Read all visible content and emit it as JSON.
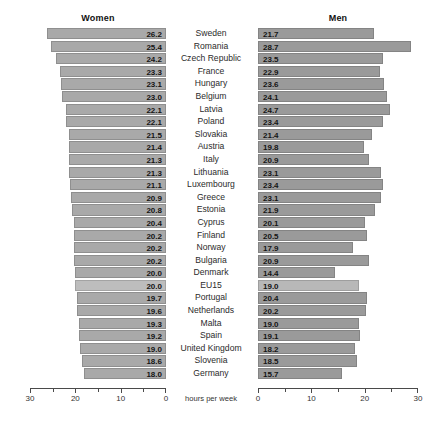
{
  "chart_data": {
    "type": "bar",
    "title": "",
    "subtitle": "",
    "orientation": "horizontal-diverging",
    "xlabel": "hours per week",
    "ylabel": "",
    "grid": false,
    "legend_position": "top",
    "axes": {
      "left": {
        "label": "hours per week",
        "direction": "right-to-left",
        "range": [
          0,
          30
        ],
        "major_ticks": [
          30,
          20,
          10,
          0
        ],
        "tick_labels": [
          "30",
          "20",
          "10",
          "0"
        ],
        "minor_ticks": [
          25,
          15,
          5
        ]
      },
      "right": {
        "label": "hours per week",
        "direction": "left-to-right",
        "range": [
          0,
          30
        ],
        "major_ticks": [
          0,
          10,
          20,
          30
        ],
        "tick_labels": [
          "0",
          "10",
          "20",
          "30"
        ],
        "minor_ticks": [
          5,
          15,
          25
        ]
      }
    },
    "series": [
      {
        "name": "Women",
        "panel": "left",
        "color": "#a9a9a9",
        "values": [
          26.2,
          25.4,
          24.2,
          23.3,
          23.1,
          23.0,
          22.1,
          22.1,
          21.5,
          21.4,
          21.3,
          21.3,
          21.1,
          20.9,
          20.8,
          20.4,
          20.2,
          20.2,
          20.2,
          20.0,
          20.0,
          19.7,
          19.6,
          19.3,
          19.2,
          19.0,
          18.6,
          18.0
        ]
      },
      {
        "name": "Men",
        "panel": "right",
        "color": "#9a9a9a",
        "values": [
          21.7,
          28.7,
          23.5,
          22.9,
          23.6,
          24.1,
          24.7,
          23.4,
          21.4,
          19.8,
          20.9,
          23.1,
          23.4,
          23.1,
          21.9,
          20.1,
          20.5,
          17.9,
          20.9,
          14.4,
          19.0,
          20.4,
          20.2,
          19.0,
          19.1,
          18.2,
          18.5,
          15.7
        ]
      }
    ],
    "categories": [
      "Sweden",
      "Romania",
      "Czech Republic",
      "France",
      "Hungary",
      "Belgium",
      "Latvia",
      "Poland",
      "Slovakia",
      "Austria",
      "Italy",
      "Lithuania",
      "Luxembourg",
      "Greece",
      "Estonia",
      "Cyprus",
      "Finland",
      "Norway",
      "Bulgaria",
      "Denmark",
      "EU15",
      "Portugal",
      "Netherlands",
      "Malta",
      "Spain",
      "United Kingdom",
      "Slovenia",
      "Germany"
    ],
    "highlight_category": "EU15",
    "rows": [
      {
        "country": "Sweden",
        "women": 26.2,
        "men": 21.7,
        "highlight": false
      },
      {
        "country": "Romania",
        "women": 25.4,
        "men": 28.7,
        "highlight": false
      },
      {
        "country": "Czech Republic",
        "women": 24.2,
        "men": 23.5,
        "highlight": false
      },
      {
        "country": "France",
        "women": 23.3,
        "men": 22.9,
        "highlight": false
      },
      {
        "country": "Hungary",
        "women": 23.1,
        "men": 23.6,
        "highlight": false
      },
      {
        "country": "Belgium",
        "women": 23.0,
        "men": 24.1,
        "highlight": false
      },
      {
        "country": "Latvia",
        "women": 22.1,
        "men": 24.7,
        "highlight": false
      },
      {
        "country": "Poland",
        "women": 22.1,
        "men": 23.4,
        "highlight": false
      },
      {
        "country": "Slovakia",
        "women": 21.5,
        "men": 21.4,
        "highlight": false
      },
      {
        "country": "Austria",
        "women": 21.4,
        "men": 19.8,
        "highlight": false
      },
      {
        "country": "Italy",
        "women": 21.3,
        "men": 20.9,
        "highlight": false
      },
      {
        "country": "Lithuania",
        "women": 21.3,
        "men": 23.1,
        "highlight": false
      },
      {
        "country": "Luxembourg",
        "women": 21.1,
        "men": 23.4,
        "highlight": false
      },
      {
        "country": "Greece",
        "women": 20.9,
        "men": 23.1,
        "highlight": false
      },
      {
        "country": "Estonia",
        "women": 20.8,
        "men": 21.9,
        "highlight": false
      },
      {
        "country": "Cyprus",
        "women": 20.4,
        "men": 20.1,
        "highlight": false
      },
      {
        "country": "Finland",
        "women": 20.2,
        "men": 20.5,
        "highlight": false
      },
      {
        "country": "Norway",
        "women": 20.2,
        "men": 17.9,
        "highlight": false
      },
      {
        "country": "Bulgaria",
        "women": 20.2,
        "men": 20.9,
        "highlight": false
      },
      {
        "country": "Denmark",
        "women": 20.0,
        "men": 14.4,
        "highlight": false
      },
      {
        "country": "EU15",
        "women": 20.0,
        "men": 19.0,
        "highlight": true
      },
      {
        "country": "Portugal",
        "women": 19.7,
        "men": 20.4,
        "highlight": false
      },
      {
        "country": "Netherlands",
        "women": 19.6,
        "men": 20.2,
        "highlight": false
      },
      {
        "country": "Malta",
        "women": 19.3,
        "men": 19.0,
        "highlight": false
      },
      {
        "country": "Spain",
        "women": 19.2,
        "men": 19.1,
        "highlight": false
      },
      {
        "country": "United Kingdom",
        "women": 19.0,
        "men": 18.2,
        "highlight": false
      },
      {
        "country": "Slovenia",
        "women": 18.6,
        "men": 18.5,
        "highlight": false
      },
      {
        "country": "Germany",
        "women": 18.0,
        "men": 15.7,
        "highlight": false
      }
    ]
  },
  "headers": {
    "women": "Women",
    "men": "Men"
  },
  "axis_title": "hours per week",
  "colors": {
    "bar_women": "#a9a9a9",
    "bar_men": "#9a9a9a",
    "bar_highlight_women": "#bdbdbd",
    "bar_highlight_men": "#b8b8b8",
    "axis": "#4a4a4a",
    "text": "#1a1a1a",
    "background": "#ffffff"
  }
}
